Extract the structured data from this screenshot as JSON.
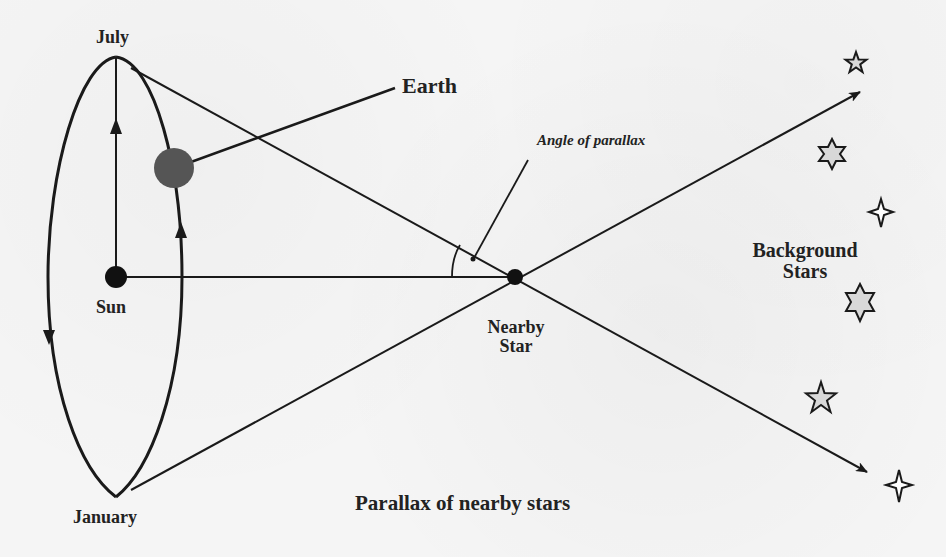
{
  "diagram": {
    "title": "Parallax of nearby stars",
    "labels": {
      "july": "July",
      "january": "January",
      "earth": "Earth",
      "sun": "Sun",
      "angle_of_parallax": "Angle of parallax",
      "nearby_star_line1": "Nearby",
      "nearby_star_line2": "Star",
      "background_stars_line1": "Background",
      "background_stars_line2": "Stars"
    },
    "colors": {
      "line": "#1a1a1a",
      "earth": "#555555",
      "sun": "#111111",
      "nearby_star": "#111111",
      "background_star_fill": "#d8d8d8",
      "text": "#222222",
      "background": "#f5f5f5"
    },
    "nodes": {
      "sun": {
        "x": 116,
        "y": 277
      },
      "nearby_star": {
        "x": 515,
        "y": 277
      },
      "earth": {
        "x": 174,
        "y": 168
      },
      "july_point": {
        "x": 116,
        "y": 57
      },
      "january_point": {
        "x": 116,
        "y": 497
      }
    },
    "background_stars": [
      {
        "type": "5-point",
        "x": 856,
        "y": 63
      },
      {
        "type": "6-point",
        "x": 832,
        "y": 154
      },
      {
        "type": "4-point",
        "x": 881,
        "y": 212
      },
      {
        "type": "6-point",
        "x": 860,
        "y": 302
      },
      {
        "type": "5-point",
        "x": 821,
        "y": 400
      },
      {
        "type": "4-point",
        "x": 899,
        "y": 485
      }
    ]
  }
}
